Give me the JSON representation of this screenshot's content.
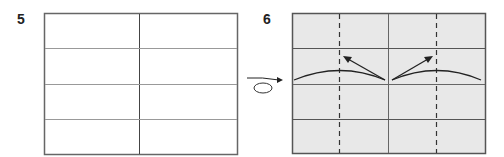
{
  "steps": [
    {
      "number": "5",
      "paper_color": "#ffffff",
      "description": "Paper with one vertical center crease and three horizontal creases"
    },
    {
      "number": "6",
      "paper_color": "#e8e8e8",
      "description": "Paper turned over; edges folded along curved arrows toward dashed valley-fold lines"
    }
  ],
  "symbols": {
    "turn_over": "turn-over-arrow",
    "fold_arrows": 2,
    "valley_fold_lines": 2
  },
  "colors": {
    "line": "#555555",
    "dark_line": "#222222",
    "gray_paper": "#e8e8e8"
  }
}
